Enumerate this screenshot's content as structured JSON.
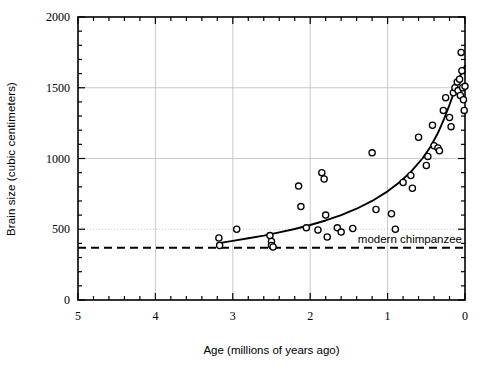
{
  "chart_data": {
    "type": "scatter",
    "title": "",
    "xlabel": "Age (millions of years ago)",
    "ylabel": "Brain size (cubic centimeters)",
    "xlim": [
      5,
      0
    ],
    "ylim": [
      0,
      2000
    ],
    "x_ticks": [
      5,
      4,
      3,
      2,
      1,
      0
    ],
    "x_tick_labels": [
      "5",
      "4",
      "3",
      "2",
      "1",
      "0"
    ],
    "x_minor_interval": 0.2,
    "y_ticks": [
      0,
      500,
      1000,
      1500,
      2000
    ],
    "y_tick_labels": [
      "0",
      "500",
      "1000",
      "1500",
      "2000"
    ],
    "y_minor_interval": 100,
    "x_axis_reversed": true,
    "grid": "major gridlines at x=4,3,2,1 and y=500 (dotted), y=1000, y=1500 (solid light gray)",
    "marker": "open circle",
    "series": [
      {
        "name": "hominin fossil brain size",
        "points": [
          [
            3.18,
            438
          ],
          [
            3.17,
            385
          ],
          [
            2.95,
            500
          ],
          [
            2.52,
            455
          ],
          [
            2.5,
            413
          ],
          [
            2.5,
            385
          ],
          [
            2.48,
            375
          ],
          [
            2.15,
            805
          ],
          [
            2.12,
            660
          ],
          [
            2.05,
            510
          ],
          [
            1.9,
            495
          ],
          [
            1.85,
            900
          ],
          [
            1.82,
            855
          ],
          [
            1.8,
            600
          ],
          [
            1.78,
            445
          ],
          [
            1.65,
            510
          ],
          [
            1.6,
            480
          ],
          [
            1.45,
            505
          ],
          [
            1.2,
            1040
          ],
          [
            1.15,
            640
          ],
          [
            0.95,
            610
          ],
          [
            0.9,
            500
          ],
          [
            0.8,
            830
          ],
          [
            0.7,
            880
          ],
          [
            0.68,
            790
          ],
          [
            0.6,
            1150
          ],
          [
            0.5,
            950
          ],
          [
            0.48,
            1015
          ],
          [
            0.42,
            1235
          ],
          [
            0.4,
            1090
          ],
          [
            0.35,
            1075
          ],
          [
            0.33,
            1055
          ],
          [
            0.28,
            1340
          ],
          [
            0.25,
            1430
          ],
          [
            0.2,
            1290
          ],
          [
            0.18,
            1225
          ],
          [
            0.15,
            1465
          ],
          [
            0.13,
            1500
          ],
          [
            0.1,
            1540
          ],
          [
            0.09,
            1480
          ],
          [
            0.07,
            1560
          ],
          [
            0.06,
            1445
          ],
          [
            0.05,
            1750
          ],
          [
            0.04,
            1620
          ],
          [
            0.03,
            1500
          ],
          [
            0.02,
            1415
          ],
          [
            0.01,
            1340
          ],
          [
            0.0,
            1510
          ]
        ]
      }
    ],
    "fit_curve": {
      "name": "exponential trend line",
      "style": "solid black",
      "points": [
        [
          3.2,
          400
        ],
        [
          3.0,
          418
        ],
        [
          2.8,
          436
        ],
        [
          2.6,
          455
        ],
        [
          2.4,
          478
        ],
        [
          2.2,
          502
        ],
        [
          2.0,
          530
        ],
        [
          1.8,
          562
        ],
        [
          1.6,
          600
        ],
        [
          1.4,
          645
        ],
        [
          1.2,
          700
        ],
        [
          1.0,
          768
        ],
        [
          0.85,
          830
        ],
        [
          0.7,
          905
        ],
        [
          0.55,
          1000
        ],
        [
          0.45,
          1080
        ],
        [
          0.35,
          1180
        ],
        [
          0.27,
          1280
        ],
        [
          0.2,
          1380
        ],
        [
          0.14,
          1470
        ],
        [
          0.09,
          1545
        ],
        [
          0.05,
          1600
        ],
        [
          0.02,
          1635
        ],
        [
          0.0,
          1655
        ]
      ]
    },
    "reference_line": {
      "label": "modern chimpanzee",
      "value": 370,
      "style": "dashed black",
      "label_position": "right, above line"
    }
  },
  "figure": {
    "caption": ""
  },
  "colors": {
    "axis": "#000000",
    "grid": "#bdbdbd",
    "marker": "#000000",
    "curve": "#000000",
    "reference": "#000000",
    "background": "#ffffff"
  }
}
